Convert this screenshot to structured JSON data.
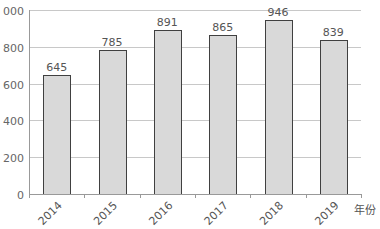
{
  "chart_data": {
    "type": "bar",
    "title": "",
    "xlabel": "年份",
    "ylabel": "",
    "categories": [
      "2014",
      "2015",
      "2016",
      "2017",
      "2018",
      "2019"
    ],
    "values": [
      645,
      785,
      891,
      865,
      946,
      839
    ],
    "ylim": [
      0,
      1000
    ],
    "yticks": [
      0,
      200,
      400,
      600,
      800,
      1000
    ],
    "ytick_labels": [
      "0",
      "200",
      "400",
      "600",
      "800",
      "1 000"
    ],
    "grid": true,
    "legend": null,
    "data_labels": true,
    "colors": {
      "bar_fill": "#d9d9d9",
      "bar_stroke": "#404040",
      "grid": "#c8c8c8",
      "axis": "#999999"
    }
  }
}
